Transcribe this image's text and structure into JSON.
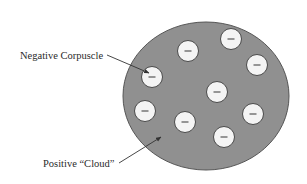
{
  "diagram": {
    "colors": {
      "background": "#ffffff",
      "cloud_fill": "#909090",
      "cloud_stroke": "#555555",
      "corpuscle_fill": "#f4f4f4",
      "corpuscle_stroke": "#4a4a4a",
      "minus_stroke": "#555555",
      "arrow": "#333333",
      "text": "#2a2a2a"
    },
    "cloud": {
      "cx": 206,
      "cy": 96,
      "rx": 83,
      "ry": 74,
      "label": "Positive “Cloud”",
      "label_x": 43,
      "label_y": 167,
      "arrow": {
        "x1": 119,
        "y1": 163,
        "x2": 161,
        "y2": 137
      }
    },
    "corpuscle_label": {
      "text": "Negative Corpuscle",
      "x": 20,
      "y": 59,
      "arrow": {
        "x1": 107,
        "y1": 55,
        "x2": 149,
        "y2": 73
      }
    },
    "corpuscle_radius": 10.5,
    "corpuscle_symbol": "−",
    "corpuscles": [
      {
        "id": "c1",
        "cx": 188,
        "cy": 51
      },
      {
        "id": "c2",
        "cx": 231,
        "cy": 39
      },
      {
        "id": "c3",
        "cx": 257,
        "cy": 65
      },
      {
        "id": "c4",
        "cx": 152,
        "cy": 77
      },
      {
        "id": "c5",
        "cx": 217,
        "cy": 92
      },
      {
        "id": "c6",
        "cx": 145,
        "cy": 111
      },
      {
        "id": "c7",
        "cx": 185,
        "cy": 122
      },
      {
        "id": "c8",
        "cx": 253,
        "cy": 114
      },
      {
        "id": "c9",
        "cx": 224,
        "cy": 137
      }
    ]
  }
}
